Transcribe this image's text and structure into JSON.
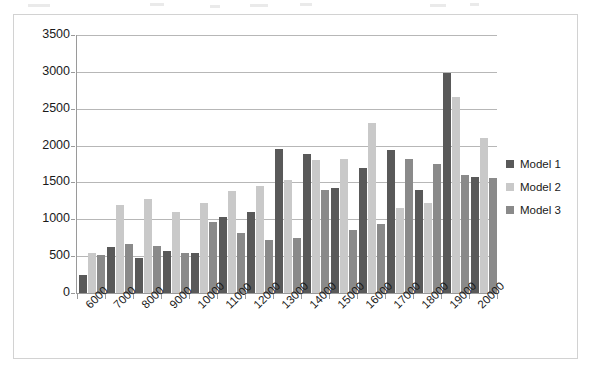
{
  "chart_data": {
    "type": "bar",
    "title": "",
    "subtitle": "",
    "xlabel": "",
    "ylabel": "",
    "grid": true,
    "legend_position": "right",
    "ylim": [
      0,
      3500
    ],
    "ytick_step": 500,
    "ytick_labels": [
      "3500",
      "3000",
      "2500",
      "2000",
      "1500",
      "1000",
      "500",
      "0"
    ],
    "ytick_values": [
      3500,
      3000,
      2500,
      2000,
      1500,
      1000,
      500,
      0
    ],
    "categories": [
      "6000",
      "7000",
      "8000",
      "9000",
      "10000",
      "11000",
      "12000",
      "13000",
      "14000",
      "15000",
      "16000",
      "17000",
      "18000",
      "19000",
      "20000"
    ],
    "series": [
      {
        "name": "Model 1",
        "color": "#595959",
        "values": [
          250,
          630,
          470,
          575,
          545,
          1025,
          1095,
          1950,
          1890,
          1430,
          1700,
          1940,
          1400,
          2980,
          1570
        ]
      },
      {
        "name": "Model 2",
        "color": "#c9c9c9",
        "values": [
          540,
          1190,
          1275,
          1095,
          1215,
          1380,
          1455,
          1530,
          1800,
          1820,
          2310,
          1150,
          1220,
          2665,
          2100
        ]
      },
      {
        "name": "Model 3",
        "color": "#8a8a8a",
        "values": [
          520,
          670,
          640,
          545,
          960,
          820,
          725,
          750,
          1400,
          860,
          930,
          1820,
          1750,
          1600,
          1560
        ]
      }
    ]
  },
  "legend": {
    "items": [
      {
        "label": "Model 1",
        "color": "#595959"
      },
      {
        "label": "Model 2",
        "color": "#c9c9c9"
      },
      {
        "label": "Model 3",
        "color": "#8a8a8a"
      }
    ]
  }
}
